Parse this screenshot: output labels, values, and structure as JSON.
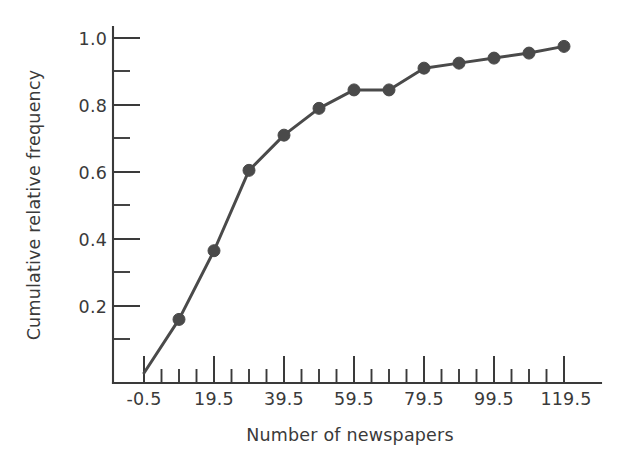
{
  "chart_data": {
    "type": "line",
    "title": "",
    "subtitle": "",
    "xlabel": "Number of newspapers",
    "ylabel": "Cumulative relative frequency",
    "xlim": [
      -0.5,
      124.5
    ],
    "ylim": [
      0.0,
      1.05
    ],
    "grid": false,
    "legend": null,
    "x_major_ticks": [
      -0.5,
      19.5,
      39.5,
      59.5,
      79.5,
      99.5,
      119.5
    ],
    "x_major_tick_labels": [
      "-0.5",
      "19.5",
      "39.5",
      "59.5",
      "79.5",
      "99.5",
      "119.5"
    ],
    "x_minor_ticks": [
      4.5,
      9.5,
      14.5,
      24.5,
      29.5,
      34.5,
      44.5,
      49.5,
      54.5,
      64.5,
      69.5,
      74.5,
      84.5,
      89.5,
      94.5,
      104.5,
      109.5,
      114.5
    ],
    "y_major_ticks": [
      0.2,
      0.4,
      0.6,
      0.8,
      1.0
    ],
    "y_major_tick_labels": [
      "0.2",
      "0.4",
      "0.6",
      "0.8",
      "1.0"
    ],
    "y_minor_ticks": [
      0.1,
      0.3,
      0.5,
      0.7,
      0.9
    ],
    "marker": "circle",
    "marker_color": "#4a4a4a",
    "line_color": "#4a4a4a",
    "background_color": "#ffffff",
    "series": [
      {
        "name": "Cumulative relative frequency",
        "x": [
          -0.5,
          9.5,
          19.5,
          29.5,
          39.5,
          49.5,
          59.5,
          69.5,
          79.5,
          89.5,
          99.5,
          109.5,
          119.5
        ],
        "values": [
          0.0,
          0.16,
          0.365,
          0.605,
          0.71,
          0.79,
          0.845,
          0.845,
          0.91,
          0.925,
          0.94,
          0.955,
          0.975
        ],
        "show_marker_at_origin": false
      }
    ]
  }
}
